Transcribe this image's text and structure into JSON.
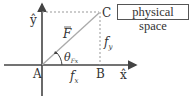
{
  "diagram": {
    "title_box": "physical space",
    "points": {
      "A": "A",
      "B": "B",
      "C": "C"
    },
    "axes": {
      "x": "x̂",
      "y": "ŷ"
    },
    "vector_label": "F",
    "components": {
      "fx_main": "f",
      "fx_sub": "x",
      "fy_main": "f",
      "fy_sub": "y"
    },
    "angle": {
      "main": "θ",
      "sub": "Fx"
    },
    "colors": {
      "axis": "#444444",
      "vector": "#aaaaaa",
      "dashed": "#999999",
      "text": "#333333"
    }
  }
}
